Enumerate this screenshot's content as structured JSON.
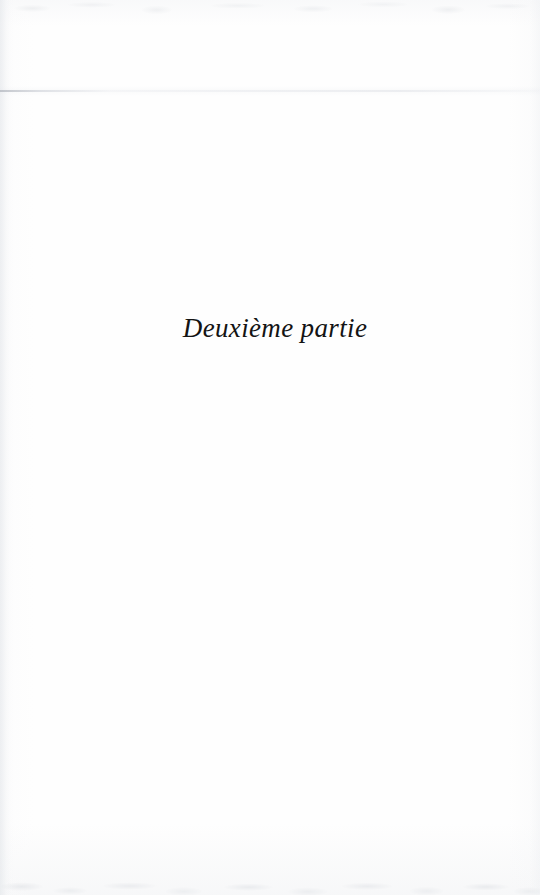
{
  "document": {
    "type": "scanned-book-page",
    "page_kind": "part-divider",
    "language": "fr",
    "page_width": 540,
    "page_height": 895,
    "background_color": "#fefefe",
    "ink_color": "#141414"
  },
  "content": {
    "part_title": "Deuxième partie",
    "part_title_style": "italic-serif",
    "part_title_position": "upper-middle-centered"
  },
  "artifacts": {
    "scan_streak_label": "horizontal scan line",
    "top_noise_label": "top edge scan noise",
    "bottom_noise_label": "bottom edge scan noise",
    "left_gutter_label": "left gutter shading",
    "right_gutter_label": "right edge shading"
  }
}
